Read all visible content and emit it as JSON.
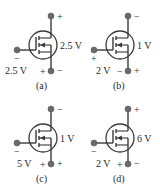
{
  "figure": {
    "colors": {
      "line": "#3a3a3a",
      "terminal": "#6a6a6a",
      "text": "#2a2a2a"
    },
    "circuits": [
      {
        "id": "a",
        "caption": "(a)",
        "drain_source_voltage": "2.5 V",
        "drain_top_sign": "+",
        "drain_bottom_sign": "−",
        "gate_voltage": "2.5 V",
        "gate_sign": "−",
        "source_left_sign": "+"
      },
      {
        "id": "b",
        "caption": "(b)",
        "drain_source_voltage": "1 V",
        "drain_top_sign": "−",
        "drain_bottom_sign": "+",
        "gate_voltage": "2 V",
        "gate_sign": "+",
        "source_left_sign": "−"
      },
      {
        "id": "c",
        "caption": "(c)",
        "drain_source_voltage": "1 V",
        "drain_top_sign": "−",
        "drain_bottom_sign": "+",
        "gate_voltage": "5 V",
        "gate_sign": "−",
        "source_left_sign": "+"
      },
      {
        "id": "d",
        "caption": "(d)",
        "drain_source_voltage": "6 V",
        "drain_top_sign": "+",
        "drain_bottom_sign": "−",
        "gate_voltage": "2 V",
        "gate_sign": "−",
        "source_left_sign": "+"
      }
    ]
  }
}
